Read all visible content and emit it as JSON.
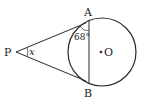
{
  "diagram": {
    "type": "circle-tangent-geometry",
    "stroke_color": "#2a2a2a",
    "background": "#ffffff",
    "points": {
      "P": {
        "label": "P",
        "x": 16,
        "y": 52
      },
      "A": {
        "label": "A",
        "x": 88,
        "y": 19
      },
      "B": {
        "label": "B",
        "x": 88,
        "y": 85
      },
      "O": {
        "label": "O",
        "x": 101,
        "y": 52
      }
    },
    "circle": {
      "cx": 102,
      "cy": 52,
      "r": 34
    },
    "angles": {
      "at_A": {
        "label": "68°",
        "value": 68
      },
      "at_P": {
        "label": "x"
      }
    }
  }
}
